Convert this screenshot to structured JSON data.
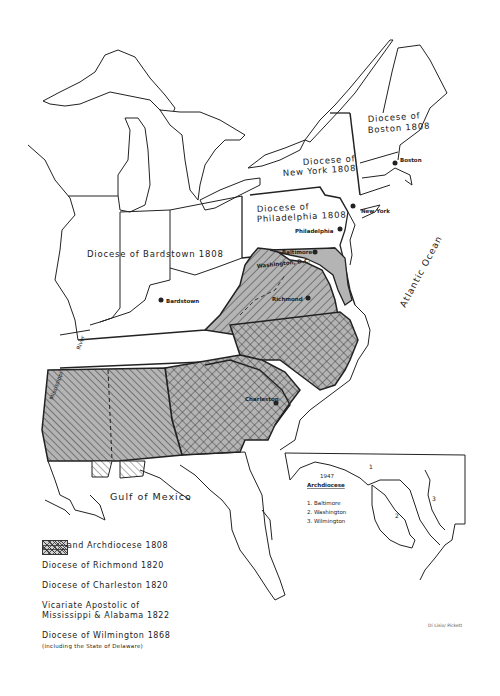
{
  "map": {
    "colors": {
      "shade": "#b4b4b4",
      "line": "#222222",
      "background": "#ffffff"
    },
    "region_labels": {
      "boston": [
        "Diocese of",
        "Boston 1808"
      ],
      "new_york": [
        "Diocese of",
        "New York 1808"
      ],
      "philadelphia": [
        "Diocese of",
        "Philadelphia 1808"
      ],
      "bardstown": "Diocese of Bardstown 1808"
    },
    "cities": {
      "boston": "Boston",
      "new_york": "New York",
      "philadelphia": "Philadelphia",
      "baltimore": "Baltimore",
      "washington": "Washington, D.C.",
      "richmond": "Richmond",
      "bardstown": "Bardstown",
      "charleston": "Charleston"
    },
    "water_labels": {
      "atlantic": "Atlantic Ocean",
      "gulf": "Gulf of Mexico",
      "river_line1": "Mississippi",
      "river_line2": "River"
    }
  },
  "inset": {
    "year": "1947",
    "title": "Archdiocese",
    "items": [
      "1. Baltimore",
      "2. Washington",
      "3. Wilmington"
    ],
    "region_numbers": [
      "1",
      "2",
      "3"
    ]
  },
  "legend": {
    "items": [
      {
        "label": "Maryland Archdiocese 1808",
        "pattern": "solid-gray"
      },
      {
        "label": "Diocese of Richmond 1820",
        "pattern": "diagonal-forward"
      },
      {
        "label": "Diocese of Charleston 1820",
        "pattern": "crosshatch"
      },
      {
        "label": "Vicariate Apostolic of Mississippi & Alabama 1822",
        "label_line1": "Vicariate Apostolic of",
        "label_line2": "Mississippi & Alabama 1822",
        "pattern": "diagonal-back"
      },
      {
        "label": "Diocese of Wilmington 1868",
        "sublabel": "(including the State of Delaware)",
        "pattern": "horizontal"
      }
    ]
  },
  "credit": "Di Lisio/ Pickett"
}
